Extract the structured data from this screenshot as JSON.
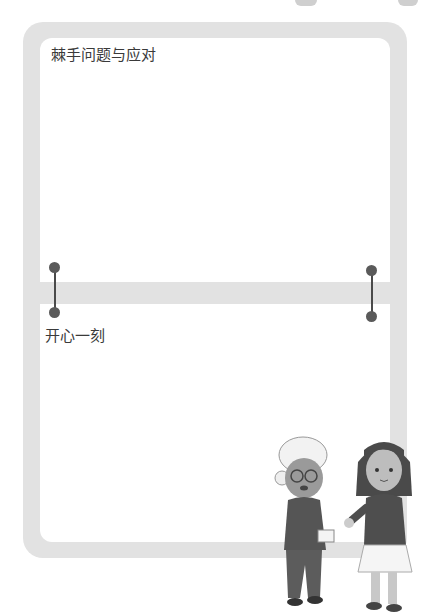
{
  "sections": [
    {
      "title": "棘手问题与应对"
    },
    {
      "title": "开心一刻"
    }
  ],
  "colors": {
    "frame": "#e2e2e2",
    "panel": "#ffffff",
    "pin": "#5a5a5a",
    "text": "#3a3a3a"
  },
  "illustration": {
    "characters": [
      "elderly-woman",
      "girl"
    ]
  }
}
